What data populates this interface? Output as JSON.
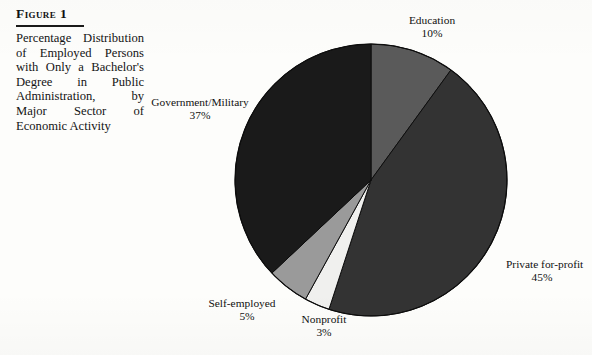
{
  "figure": {
    "label": "Figure 1",
    "caption": "Percentage Distribution of Employed Persons with Only a Bachelor's Degree in Public Administration, by Major Sector of Economic Activity"
  },
  "labels": {
    "education_name": "Education",
    "education_pct": "10%",
    "government_name": "Government/Military",
    "government_pct": "37%",
    "private_name": "Private for-profit",
    "private_pct": "45%",
    "selfemployed_name": "Self-employed",
    "selfemployed_pct": "5%",
    "nonprofit_name": "Nonprofit",
    "nonprofit_pct": "3%"
  },
  "chart_data": {
    "type": "pie",
    "title": "Percentage Distribution of Employed Persons with Only a Bachelor's Degree in Public Administration, by Major Sector of Economic Activity",
    "xlabel": "",
    "ylabel": "",
    "units": "percent",
    "total": 100,
    "start_angle_deg": 0,
    "direction": "clockwise",
    "legend": "none (direct slice labels)",
    "grid": false,
    "categories": [
      "Education",
      "Private for-profit",
      "Nonprofit",
      "Self-employed",
      "Government/Military"
    ],
    "values": [
      10,
      45,
      3,
      5,
      37
    ],
    "slices": [
      {
        "name": "Education",
        "value": 10,
        "label": "10%",
        "color": "#5a5a5a",
        "start_deg": 0.0,
        "end_deg": 36.0
      },
      {
        "name": "Private for-profit",
        "value": 45,
        "label": "45%",
        "color": "#333333",
        "start_deg": 36.0,
        "end_deg": 198.0
      },
      {
        "name": "Nonprofit",
        "value": 3,
        "label": "3%",
        "color": "#f0f0ee",
        "start_deg": 198.0,
        "end_deg": 208.8
      },
      {
        "name": "Self-employed",
        "value": 5,
        "label": "5%",
        "color": "#9a9a9a",
        "start_deg": 208.8,
        "end_deg": 226.8
      },
      {
        "name": "Government/Military",
        "value": 37,
        "label": "37%",
        "color": "#1a1a1a",
        "start_deg": 226.8,
        "end_deg": 360.0
      }
    ],
    "geometry": {
      "center_x": 138,
      "center_y": 138,
      "radius": 136
    }
  }
}
